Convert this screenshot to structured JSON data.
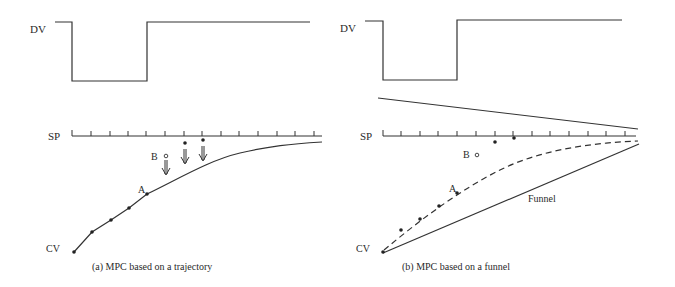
{
  "panels": [
    {
      "id": "a",
      "caption": "(a) MPC based on a trajectory",
      "labels": {
        "dv": "DV",
        "sp": "SP",
        "cv": "CV",
        "point_a": "A",
        "point_b": "B"
      },
      "dv_signal": {
        "type": "step-pulse",
        "levels": [
          "high",
          "low",
          "high"
        ]
      },
      "sp_ticks": 15,
      "reference": "trajectory",
      "arrows": 3
    },
    {
      "id": "b",
      "caption": "(b) MPC based on a funnel",
      "labels": {
        "dv": "DV",
        "sp": "SP",
        "cv": "CV",
        "point_a": "A",
        "point_b": "B",
        "funnel": "Funnel"
      },
      "dv_signal": {
        "type": "step-pulse",
        "levels": [
          "high",
          "low",
          "high"
        ]
      },
      "sp_ticks": 15,
      "reference": "funnel"
    }
  ],
  "colors": {
    "line": "#333333",
    "text": "#2a2a2a",
    "background": "#ffffff"
  }
}
